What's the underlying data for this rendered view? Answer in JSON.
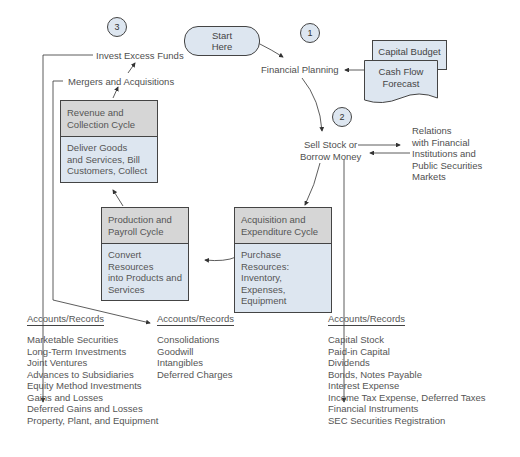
{
  "diagram": {
    "start": {
      "label_line1": "Start",
      "label_line2": "Here"
    },
    "steps": [
      {
        "number": "1",
        "label": "Financial Planning"
      },
      {
        "number": "2",
        "label_line1": "Sell Stock or",
        "label_line2": "Borrow Money"
      },
      {
        "number": "3",
        "label": "Invest Excess Funds"
      }
    ],
    "mergers": "Mergers and Acquisitions",
    "documents": {
      "capital_budget": "Capital Budget",
      "cash_flow_line1": "Cash Flow",
      "cash_flow_line2": "Forecast"
    },
    "relations": {
      "lines": [
        "Relations",
        "with Financial",
        "Institutions and",
        "Public Securities",
        "Markets"
      ]
    },
    "cycles": {
      "revenue": {
        "title_lines": [
          "Revenue and",
          "Collection Cycle"
        ],
        "body_lines": [
          "Deliver Goods",
          "and Services, Bill",
          "Customers, Collect"
        ]
      },
      "production": {
        "title_lines": [
          "Production and",
          "Payroll Cycle"
        ],
        "body_lines": [
          "Convert Resources",
          "into Products and",
          "Services"
        ]
      },
      "acquisition": {
        "title_lines": [
          "Acquisition and",
          "Expenditure Cycle"
        ],
        "body_lines": [
          "Purchase Resources:",
          "Inventory, Expenses,",
          "Equipment"
        ]
      }
    },
    "accounts": [
      {
        "title": "Accounts/Records",
        "items": [
          "Marketable Securities",
          "Long-Term Investments",
          "Joint Ventures",
          "Advances to Subsidiaries",
          "Equity Method Investments",
          "Gains and Losses",
          "Deferred Gains and Losses",
          "Property, Plant, and Equipment"
        ]
      },
      {
        "title": "Accounts/Records",
        "items": [
          "Consolidations",
          "Goodwill",
          "Intangibles",
          "Deferred Charges"
        ]
      },
      {
        "title": "Accounts/Records",
        "items": [
          "Capital Stock",
          "Paid-in Capital",
          "Dividends",
          "Bonds, Notes Payable",
          "Interest Expense",
          "Income Tax Expense, Deferred Taxes",
          "Financial Instruments",
          "SEC Securities Registration"
        ]
      }
    ],
    "colors": {
      "fill_blue": "#dde6f0",
      "fill_gray": "#d6d6d6",
      "stroke": "#444444",
      "text": "#555555"
    }
  }
}
